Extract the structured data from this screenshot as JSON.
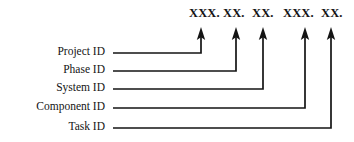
{
  "diagram": {
    "type": "callout-diagram",
    "background_color": "#ffffff",
    "line_color": "#141414",
    "text_color": "#141414",
    "mask": {
      "full_text": "XXX. XX. XX. XXX. XX.",
      "segments": [
        {
          "text": "XXX.",
          "x": 189,
          "y": 17,
          "chars": 3
        },
        {
          "text": "XX.",
          "x": 223,
          "y": 17,
          "chars": 2
        },
        {
          "text": "XX.",
          "x": 252,
          "y": 17,
          "chars": 2
        },
        {
          "text": "XXX.",
          "x": 283,
          "y": 17,
          "chars": 3
        },
        {
          "text": "XX.",
          "x": 321,
          "y": 17,
          "chars": 2
        }
      ]
    },
    "rows": [
      {
        "label": "Project ID",
        "label_x": 105,
        "label_y": 55,
        "line_y": 53,
        "line_start_x": 113,
        "arrow_x": 201,
        "arrow_tip_y": 28
      },
      {
        "label": "Phase ID",
        "label_x": 105,
        "label_y": 73,
        "line_y": 71,
        "line_start_x": 113,
        "arrow_x": 236,
        "arrow_tip_y": 28
      },
      {
        "label": "System ID",
        "label_x": 105,
        "label_y": 91,
        "line_y": 89,
        "line_start_x": 113,
        "arrow_x": 263,
        "arrow_tip_y": 28
      },
      {
        "label": "Component ID",
        "label_x": 105,
        "label_y": 110,
        "line_y": 108,
        "line_start_x": 113,
        "arrow_x": 305,
        "arrow_tip_y": 28
      },
      {
        "label": "Task ID",
        "label_x": 105,
        "label_y": 130,
        "line_y": 128,
        "line_start_x": 113,
        "arrow_x": 331,
        "arrow_tip_y": 28
      }
    ]
  }
}
